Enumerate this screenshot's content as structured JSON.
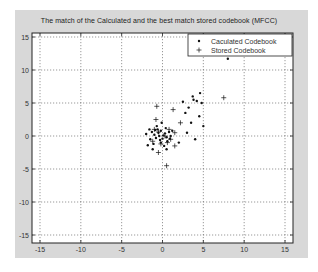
{
  "chart_data": {
    "type": "scatter",
    "title": "The match of the Calculated and the best match stored codebook (MFCC)",
    "xlabel": "",
    "ylabel": "",
    "xlim": [
      -16,
      16
    ],
    "ylim": [
      -16,
      16
    ],
    "xticks": [
      -15,
      -10,
      -5,
      0,
      5,
      10,
      15
    ],
    "yticks": [
      -15,
      -10,
      -5,
      0,
      5,
      10,
      15
    ],
    "grid": true,
    "legend_position": "upper right",
    "series": [
      {
        "name": "Caculated Codebook",
        "marker": "dot",
        "points": [
          [
            -0.5,
            0.5
          ],
          [
            -1.0,
            0.2
          ],
          [
            -0.2,
            0.8
          ],
          [
            0.3,
            0.4
          ],
          [
            -0.8,
            -0.3
          ],
          [
            0.5,
            -0.2
          ],
          [
            -0.3,
            -0.6
          ],
          [
            0.1,
            0.1
          ],
          [
            -1.3,
            0.6
          ],
          [
            -0.6,
            1.0
          ],
          [
            0.8,
            0.6
          ],
          [
            -1.5,
            -0.5
          ],
          [
            -0.2,
            -1.0
          ],
          [
            0.6,
            -0.8
          ],
          [
            -1.1,
            -1.2
          ],
          [
            0.2,
            -1.5
          ],
          [
            -0.7,
            1.5
          ],
          [
            0.4,
            1.2
          ],
          [
            -1.6,
            1.0
          ],
          [
            1.0,
            0.0
          ],
          [
            -0.4,
            0.0
          ],
          [
            0.0,
            -0.4
          ],
          [
            -0.9,
            0.9
          ],
          [
            0.9,
            -0.4
          ],
          [
            -1.8,
            -1.4
          ],
          [
            -1.2,
            -2.0
          ],
          [
            0.5,
            -2.0
          ],
          [
            1.2,
            0.8
          ],
          [
            -0.1,
            2.0
          ],
          [
            -2.0,
            0.3
          ],
          [
            3.0,
            0.5
          ],
          [
            2.0,
            -1.0
          ],
          [
            3.5,
            2.0
          ],
          [
            4.5,
            3.0
          ],
          [
            4.0,
            -0.5
          ],
          [
            5.0,
            1.5
          ],
          [
            4.8,
            5.0
          ],
          [
            4.6,
            6.5
          ],
          [
            3.8,
            5.5
          ],
          [
            2.5,
            5.2
          ],
          [
            2.8,
            3.5
          ],
          [
            3.2,
            4.3
          ],
          [
            3.7,
            6.0
          ],
          [
            4.2,
            5.3
          ],
          [
            8.0,
            11.7
          ]
        ]
      },
      {
        "name": "Stored Codebook",
        "marker": "plus",
        "points": [
          [
            -0.7,
            4.5
          ],
          [
            -0.8,
            2.5
          ],
          [
            1.3,
            4.0
          ],
          [
            -0.5,
            -2.5
          ],
          [
            0.5,
            -4.5
          ],
          [
            1.5,
            -1.5
          ],
          [
            -1.0,
            1.0
          ],
          [
            0.8,
            1.0
          ],
          [
            -1.2,
            -0.8
          ],
          [
            0.3,
            0.0
          ],
          [
            -0.2,
            -1.2
          ],
          [
            1.0,
            -0.5
          ],
          [
            7.5,
            5.8
          ],
          [
            1.5,
            0.5
          ],
          [
            -0.5,
            0.6
          ],
          [
            0.6,
            -1.0
          ],
          [
            2.2,
            2.0
          ]
        ]
      }
    ]
  },
  "legend": {
    "items": [
      {
        "label": "Caculated Codebook",
        "marker": "•"
      },
      {
        "label": "Stored Codebook",
        "marker": "+"
      }
    ]
  },
  "colors": {
    "figure_bg": "#d8d8d8",
    "axes_bg": "#ffffff",
    "marker": "#111111",
    "grid": "#555555"
  }
}
